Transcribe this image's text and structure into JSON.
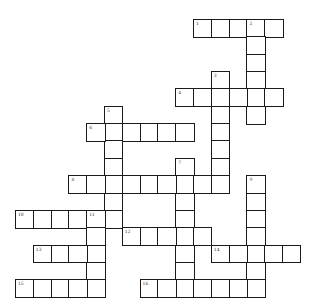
{
  "puzzle": {
    "type": "crossword",
    "grid_origin": {
      "x": 15,
      "y": 19
    },
    "cell_size": {
      "w": 17.8,
      "h": 17.35
    },
    "colors": {
      "border": "#1a1a1a",
      "cell_fill": "#ffffff",
      "number": "#333333"
    },
    "words": [
      {
        "number": "1",
        "direction": "across",
        "row": 0,
        "col": 10,
        "length": 5
      },
      {
        "number": "2",
        "direction": "down",
        "row": 0,
        "col": 13,
        "length": 6
      },
      {
        "number": "3",
        "direction": "down",
        "row": 3,
        "col": 11,
        "length": 7
      },
      {
        "number": "4",
        "direction": "across",
        "row": 4,
        "col": 9,
        "length": 6
      },
      {
        "number": "5",
        "direction": "down",
        "row": 5,
        "col": 5,
        "length": 7
      },
      {
        "number": "6",
        "direction": "across",
        "row": 6,
        "col": 4,
        "length": 6
      },
      {
        "number": "7",
        "direction": "down",
        "row": 8,
        "col": 9,
        "length": 8
      },
      {
        "number": "8",
        "direction": "across",
        "row": 9,
        "col": 3,
        "length": 9
      },
      {
        "number": "9",
        "direction": "down",
        "row": 9,
        "col": 13,
        "length": 7
      },
      {
        "number": "10",
        "direction": "across",
        "row": 11,
        "col": 0,
        "length": 6
      },
      {
        "number": "11",
        "direction": "down",
        "row": 11,
        "col": 4,
        "length": 5
      },
      {
        "number": "12",
        "direction": "across",
        "row": 12,
        "col": 6,
        "length": 5
      },
      {
        "number": "13",
        "direction": "across",
        "row": 13,
        "col": 1,
        "length": 4
      },
      {
        "number": "14",
        "direction": "across",
        "row": 13,
        "col": 11,
        "length": 5
      },
      {
        "number": "15",
        "direction": "across",
        "row": 15,
        "col": 0,
        "length": 5
      },
      {
        "number": "16",
        "direction": "across",
        "row": 15,
        "col": 7,
        "length": 7
      }
    ]
  }
}
